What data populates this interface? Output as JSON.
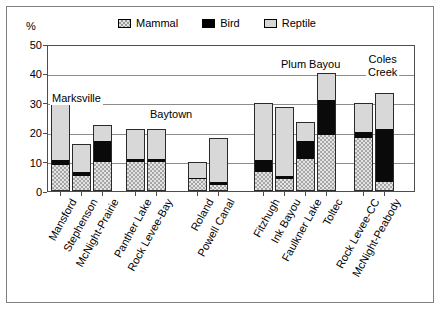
{
  "chart_data": {
    "type": "bar",
    "subtype": "stacked",
    "title": "",
    "xlabel": "",
    "ylabel": "%",
    "ylim": [
      0,
      50
    ],
    "yticks": [
      0,
      10,
      20,
      30,
      40,
      50
    ],
    "grid": true,
    "legend_position": "top",
    "categories": [
      "Mansford",
      "Stephenson",
      "McNight-Prairie",
      "Panther Lake",
      "Rock Levee-Bay",
      "Roland",
      "Powell Canal",
      "Fitzhugh",
      "Ink Bayou",
      "Faulkner Lake",
      "Toltec",
      "Rock Levee-CC",
      "McNight-Peabody"
    ],
    "series": [
      {
        "name": "Mammal",
        "color": "#e4e4e4",
        "pattern": "checker",
        "values": [
          9.0,
          5.0,
          10.0,
          10.0,
          10.0,
          4.0,
          2.0,
          6.5,
          4.0,
          11.0,
          19.0,
          18.0,
          3.0
        ]
      },
      {
        "name": "Bird",
        "color": "#0a0a0a",
        "pattern": "solid",
        "values": [
          1.5,
          1.5,
          7.0,
          1.0,
          1.0,
          0.5,
          1.0,
          4.0,
          1.0,
          6.0,
          12.0,
          2.0,
          18.0
        ]
      },
      {
        "name": "Reptile",
        "color": "#d8d8d8",
        "pattern": "solid-light",
        "values": [
          19.5,
          9.5,
          5.5,
          10.0,
          10.0,
          5.5,
          15.0,
          19.5,
          23.5,
          6.5,
          9.0,
          10.0,
          12.5
        ]
      }
    ],
    "totals": [
      30.0,
      16.0,
      22.5,
      21.0,
      21.0,
      10.0,
      18.0,
      30.0,
      28.5,
      23.5,
      40.0,
      30.0,
      33.5
    ],
    "group_labels": [
      "Marksville",
      "Baytown",
      "Plum Bayou",
      "Coles Creek"
    ],
    "group_membership": [
      {
        "label": "Marksville",
        "categories": [
          "Mansford",
          "Stephenson",
          "McNight-Prairie"
        ]
      },
      {
        "label": "Baytown",
        "categories": [
          "Panther Lake",
          "Rock Levee-Bay",
          "Roland",
          "Powell Canal"
        ]
      },
      {
        "label": "Plum Bayou",
        "categories": [
          "Fitzhugh",
          "Ink Bayou",
          "Faulkner Lake",
          "Toltec"
        ]
      },
      {
        "label": "Coles Creek",
        "categories": [
          "Rock Levee-CC",
          "McNight-Peabody"
        ]
      }
    ]
  },
  "axis": {
    "y_unit_label": "%",
    "y_ticks": [
      "50",
      "40",
      "30",
      "20",
      "10",
      "0"
    ]
  },
  "legend": {
    "items": [
      {
        "label": "Mammal",
        "swatch": "mammal-swatch"
      },
      {
        "label": "Bird",
        "swatch": "bird-swatch"
      },
      {
        "label": "Reptile",
        "swatch": "reptile-swatch"
      }
    ]
  },
  "group_annotations": [
    {
      "label": "Marksville",
      "line2": ""
    },
    {
      "label": "Baytown",
      "line2": ""
    },
    {
      "label": "Plum Bayou",
      "line2": ""
    },
    {
      "label": "Coles",
      "line2": "Creek"
    }
  ],
  "x_labels": [
    "Mansford",
    "Stephenson",
    "McNight-Prairie",
    "Panther Lake",
    "Rock Levee-Bay",
    "Roland",
    "Powell Canal",
    "Fitzhugh",
    "Ink Bayou",
    "Faulkner Lake",
    "Toltec",
    "Rock Levee-CC",
    "McNight-Peabody"
  ]
}
